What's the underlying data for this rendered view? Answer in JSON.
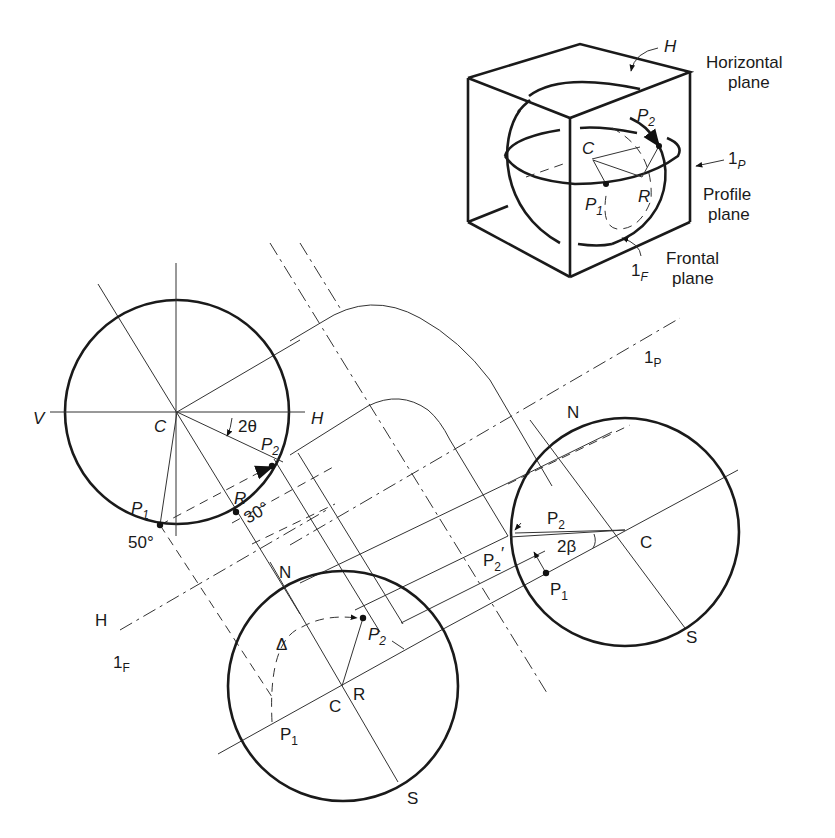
{
  "figure": {
    "inset": {
      "horizontal_plane_label": [
        "Horizontal",
        "plane"
      ],
      "profile_plane_label": [
        "Profile",
        "plane"
      ],
      "frontal_plane_label": [
        "Frontal",
        "plane"
      ],
      "h_marker": "H",
      "one_p_marker": {
        "main": "1",
        "sub": "P"
      },
      "one_f_marker": {
        "main": "1",
        "sub": "F"
      },
      "points": {
        "c": "C",
        "p1": "P",
        "p1_sub": "1",
        "p2": "P",
        "p2_sub": "2",
        "r": "R"
      }
    },
    "left_view": {
      "v": "V",
      "h": "H",
      "c": "C",
      "angle_2theta": "2θ",
      "p2": "P",
      "p2_sub": "2",
      "r": "R",
      "p1": "P",
      "p1_sub": "1",
      "angle_30": "30°",
      "angle_50": "50°"
    },
    "right_view": {
      "n": "N",
      "s": "S",
      "c": "C",
      "p2": "P",
      "p2_sub": "2",
      "p2_prime": "P",
      "p2_prime_sub": "2",
      "p2_prime_mark": "′",
      "angle_2beta": "2β",
      "p1": "P",
      "p1_sub": "1",
      "one_p": {
        "main": "1",
        "sub": "P"
      }
    },
    "bottom_view": {
      "n": "N",
      "s": "S",
      "c": "C",
      "r": "R",
      "delta": "Δ",
      "p2": "P",
      "p2_sub": "2",
      "p1": "P",
      "p1_sub": "1",
      "h": "H",
      "one_f": {
        "main": "1",
        "sub": "F"
      }
    }
  }
}
